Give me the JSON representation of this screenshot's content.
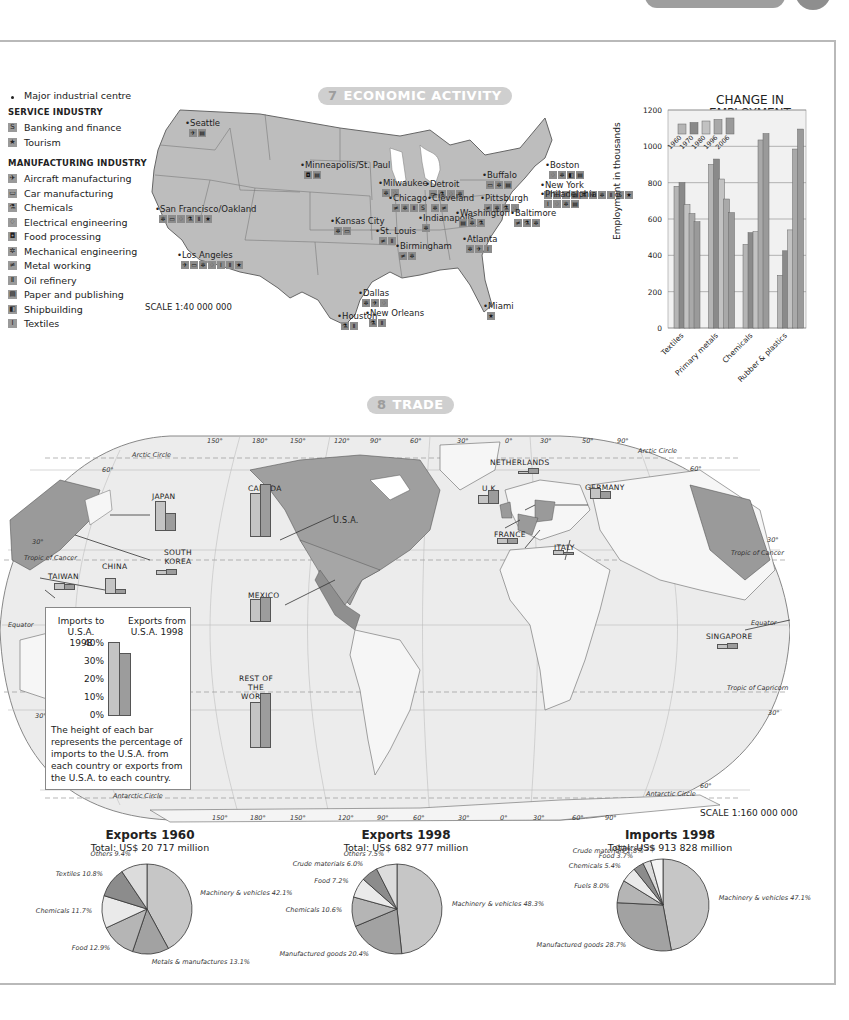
{
  "sections": {
    "economic": {
      "number": "7",
      "title": "ECONOMIC ACTIVITY"
    },
    "trade": {
      "number": "8",
      "title": "TRADE"
    }
  },
  "legend": {
    "major_centre": "Major industrial centre",
    "service_heading": "SERVICE INDUSTRY",
    "service_items": [
      {
        "icon": "S",
        "label": "Banking and finance"
      },
      {
        "icon": "★",
        "label": "Tourism"
      }
    ],
    "manufacturing_heading": "MANUFACTURING INDUSTRY",
    "manufacturing_items": [
      {
        "icon": "✈",
        "label": "Aircraft manufacturing"
      },
      {
        "icon": "▭",
        "label": "Car manufacturing"
      },
      {
        "icon": "⚗",
        "label": "Chemicals"
      },
      {
        "icon": "♢",
        "label": "Electrical engineering"
      },
      {
        "icon": "◘",
        "label": "Food processing"
      },
      {
        "icon": "✲",
        "label": "Mechanical engineering"
      },
      {
        "icon": "≠",
        "label": "Metal working"
      },
      {
        "icon": "Ⅱ",
        "label": "Oil refinery"
      },
      {
        "icon": "▤",
        "label": "Paper and publishing"
      },
      {
        "icon": "◧",
        "label": "Shipbuilding"
      },
      {
        "icon": "Ⅰ",
        "label": "Textiles"
      }
    ]
  },
  "us_map": {
    "scale": "SCALE 1:40 000 000",
    "cities": [
      {
        "name": "Seattle",
        "x": 45,
        "y": 18,
        "icons": [
          "✈",
          "▤"
        ]
      },
      {
        "name": "Minneapolis/St. Paul",
        "x": 160,
        "y": 60,
        "icons": [
          "◘",
          "▤"
        ]
      },
      {
        "name": "Milwaukee",
        "x": 238,
        "y": 78,
        "icons": [
          "✲",
          "♢"
        ]
      },
      {
        "name": "Detroit",
        "x": 285,
        "y": 79,
        "icons": [
          "▭",
          "⚗",
          "♢",
          "✲"
        ]
      },
      {
        "name": "Chicago",
        "x": 248,
        "y": 93,
        "icons": [
          "≠",
          "✲",
          "Ⅱ",
          "S"
        ]
      },
      {
        "name": "Cleveland",
        "x": 287,
        "y": 93,
        "icons": [
          "✲",
          "≠"
        ]
      },
      {
        "name": "Buffalo",
        "x": 342,
        "y": 70,
        "icons": [
          "▭",
          "✲",
          "▤"
        ]
      },
      {
        "name": "Pittsburgh",
        "x": 340,
        "y": 93,
        "icons": [
          "≠",
          "✲",
          "⚗",
          "♢"
        ]
      },
      {
        "name": "Indianapolis",
        "x": 278,
        "y": 113,
        "icons": [
          "✲"
        ]
      },
      {
        "name": "Washington",
        "x": 315,
        "y": 108,
        "icons": [
          "▤",
          "✲",
          "⚗"
        ]
      },
      {
        "name": "Baltimore",
        "x": 370,
        "y": 108,
        "icons": [
          "≠",
          "⚗",
          "✲"
        ]
      },
      {
        "name": "Boston",
        "x": 405,
        "y": 60,
        "icons": [
          "♢",
          "✲",
          "◧",
          "▤"
        ]
      },
      {
        "name": "New York",
        "x": 400,
        "y": 80,
        "icons": [
          "♢",
          "▭",
          "Ⅰ",
          "▤",
          "⚗",
          "✈",
          "✲",
          "Ⅱ",
          "S",
          "★"
        ]
      },
      {
        "name": "Philadelphia",
        "x": 400,
        "y": 89,
        "icons": [
          "Ⅰ",
          "♢",
          "✲",
          "▤"
        ]
      },
      {
        "name": "Kansas City",
        "x": 190,
        "y": 116,
        "icons": [
          "✲",
          "▭"
        ]
      },
      {
        "name": "St. Louis",
        "x": 235,
        "y": 126,
        "icons": [
          "≠",
          "Ⅱ"
        ]
      },
      {
        "name": "San Francisco/Oakland",
        "x": 15,
        "y": 104,
        "icons": [
          "✲",
          "▭",
          "♢",
          "⚗",
          "Ⅱ",
          "★"
        ]
      },
      {
        "name": "Los Angeles",
        "x": 37,
        "y": 150,
        "icons": [
          "✈",
          "▭",
          "✲",
          "♢",
          "Ⅰ",
          "Ⅱ",
          "★"
        ]
      },
      {
        "name": "Birmingham",
        "x": 255,
        "y": 141,
        "icons": [
          "≠",
          "✲"
        ]
      },
      {
        "name": "Atlanta",
        "x": 322,
        "y": 134,
        "icons": [
          "✲",
          "✈",
          "Ⅰ"
        ]
      },
      {
        "name": "Dallas",
        "x": 218,
        "y": 188,
        "icons": [
          "✲",
          "✈",
          "♢"
        ]
      },
      {
        "name": "Houston",
        "x": 197,
        "y": 211,
        "icons": [
          "⚗",
          "Ⅱ"
        ]
      },
      {
        "name": "New Orleans",
        "x": 225,
        "y": 208,
        "icons": [
          "⚗",
          "Ⅱ"
        ]
      },
      {
        "name": "Miami",
        "x": 343,
        "y": 201,
        "icons": [
          "★"
        ]
      }
    ]
  },
  "chart_data": [
    {
      "type": "bar",
      "title": "CHANGE IN EMPLOYMENT",
      "subtitle": "by selected sectors",
      "xlabel": "",
      "ylabel": "Employment in thousands",
      "ylim": [
        0,
        1200
      ],
      "yticks": [
        0,
        200,
        400,
        600,
        800,
        1000,
        1200
      ],
      "grid": true,
      "categories": [
        "Textiles",
        "Primary metals",
        "Chemicals",
        "Rubber & plastics"
      ],
      "series": [
        {
          "name": "1960",
          "values": [
            780,
            900,
            460,
            290
          ]
        },
        {
          "name": "1970",
          "values": [
            800,
            930,
            525,
            425
          ]
        },
        {
          "name": "1980",
          "values": [
            680,
            820,
            530,
            540
          ]
        },
        {
          "name": "1996",
          "values": [
            630,
            710,
            1035,
            985
          ]
        },
        {
          "name": "2006 (projected)",
          "values": [
            585,
            635,
            1070,
            1095
          ]
        }
      ],
      "series_colors": [
        "#b5b5b5",
        "#8a8a8a",
        "#c2c2c2",
        "#a9a9a9",
        "#9a9a9a"
      ]
    },
    {
      "type": "bar",
      "title": "U.S.A. trade partners 1998",
      "ylabel": "Percentage",
      "ylim": [
        0,
        40
      ],
      "yticks": [
        "0%",
        "10%",
        "20%",
        "30%",
        "40%"
      ],
      "categories": [
        "Canada",
        "Rest of the World",
        "Japan",
        "Mexico",
        "China",
        "Germany",
        "U.K.",
        "Taiwan",
        "South Korea",
        "France",
        "Italy",
        "Netherlands",
        "Singapore"
      ],
      "series": [
        {
          "name": "Imports to U.S.A. 1998",
          "values": [
            19,
            20,
            13,
            10,
            7,
            5,
            4,
            3,
            2,
            2.5,
            2,
            1,
            2
          ]
        },
        {
          "name": "Exports from U.S.A. 1998",
          "values": [
            23,
            24,
            8,
            11,
            2,
            3.5,
            6,
            2.5,
            2.5,
            2.5,
            1,
            2.5,
            2.5
          ]
        }
      ]
    },
    {
      "type": "pie",
      "title": "Exports 1960",
      "subtitle": "Total: US$ 20 717 million",
      "slices": [
        {
          "label": "Machinery & vehicles",
          "value": 42.1
        },
        {
          "label": "Metals & manufactures",
          "value": 13.1
        },
        {
          "label": "Food",
          "value": 12.9
        },
        {
          "label": "Chemicals",
          "value": 11.7
        },
        {
          "label": "Textiles",
          "value": 10.8
        },
        {
          "label": "Others",
          "value": 9.4
        }
      ]
    },
    {
      "type": "pie",
      "title": "Exports 1998",
      "subtitle": "Total: US$ 682 977 million",
      "slices": [
        {
          "label": "Machinery & vehicles",
          "value": 48.3
        },
        {
          "label": "Manufactured goods",
          "value": 20.4
        },
        {
          "label": "Chemicals",
          "value": 10.6
        },
        {
          "label": "Food",
          "value": 7.2
        },
        {
          "label": "Crude materials",
          "value": 6.0
        },
        {
          "label": "Others",
          "value": 7.5
        }
      ]
    },
    {
      "type": "pie",
      "title": "Imports 1998",
      "subtitle": "Total: US$ 913 828 million",
      "slices": [
        {
          "label": "Machinery & vehicles",
          "value": 47.1
        },
        {
          "label": "Manufactured goods",
          "value": 28.7
        },
        {
          "label": "Fuels",
          "value": 8.0
        },
        {
          "label": "Chemicals",
          "value": 5.4
        },
        {
          "label": "Food",
          "value": 3.7
        },
        {
          "label": "Crude materials",
          "value": 2.8
        },
        {
          "label": "Others",
          "value": 4.3
        }
      ]
    }
  ],
  "trade_map": {
    "scale": "SCALE 1:160 000 000",
    "country_labels": {
      "usa": "U.S.A.",
      "canada": "CANADA",
      "mexico": "MEXICO",
      "japan": "JAPAN",
      "china": "CHINA",
      "taiwan": "TAIWAN",
      "south_korea": "SOUTH KOREA",
      "rest": "REST OF THE WORLD",
      "netherlands": "NETHERLANDS",
      "uk": "U.K.",
      "germany": "GERMANY",
      "france": "FRANCE",
      "italy": "ITALY",
      "singapore": "SINGAPORE"
    },
    "lines": {
      "arctic": "Arctic Circle",
      "cancer": "Tropic of Cancer",
      "equator": "Equator",
      "capricorn": "Tropic of Capricorn",
      "antarctic": "Antarctic Circle"
    },
    "top_lon": [
      "150°",
      "180°",
      "150°",
      "120°",
      "90°",
      "60°",
      "30°",
      "0°",
      "30°",
      "50°",
      "90°"
    ],
    "bottom_lon": [
      "150°",
      "180°",
      "150°",
      "120°",
      "90°",
      "60°",
      "30°",
      "0°",
      "30°",
      "60°",
      "90°"
    ],
    "lat": {
      "n60": "60°",
      "n30": "30°",
      "s30": "30°",
      "s60": "60°"
    },
    "key": {
      "imports": "Imports to U.S.A. 1998",
      "imports_l1": "Imports to",
      "imports_l2": "U.S.A. 1998",
      "exports_l1": "Exports from",
      "exports_l2": "U.S.A. 1998",
      "ticks": [
        "40%",
        "30%",
        "20%",
        "10%",
        "0%"
      ],
      "description": "The height of each bar represents the percentage of imports to the U.S.A. from each country or exports from the U.S.A. to each country."
    }
  }
}
